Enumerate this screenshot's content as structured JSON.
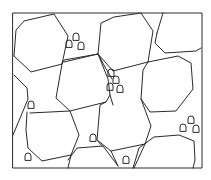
{
  "diagram": {
    "type": "grain-microstructure",
    "frame": {
      "x": 13,
      "y": 13,
      "w": 189,
      "h": 155
    },
    "stroke_color": "#2a2a2a",
    "background": "#ffffff",
    "grains": [
      {
        "id": "g1",
        "points": "14,56 16,30 24,21 54,14 68,36 62,64 31,72 14,56"
      },
      {
        "id": "g2",
        "points": "98,54 101,23 114,17 141,13 153,31 148,62 113,71 98,54"
      },
      {
        "id": "g3",
        "points": "157,33 163,13"
      },
      {
        "id": "g4",
        "points": "157,33 155,43 165,53 196,51 201,48"
      },
      {
        "id": "g5",
        "points": "62,64 56,98 70,111 106,102 110,95 108,79 98,54 64,62"
      },
      {
        "id": "g6",
        "points": "148,62 143,70 141,99 150,112 176,111 193,89 191,63 178,56 148,62"
      },
      {
        "id": "g7",
        "points": "14,75 27,88 28,99 13,135"
      },
      {
        "id": "g8",
        "points": "27,112 26,130 28,148 42,161 71,155 79,135 70,111 30,113"
      },
      {
        "id": "g9",
        "points": "106,102 100,105 97,140 111,151 145,144 151,126 141,99"
      },
      {
        "id": "g10",
        "points": "68,160 77,148 103,146 118,166"
      },
      {
        "id": "g11",
        "points": "133,168 139,148 154,137 179,135 194,141 195,160 193,168"
      },
      {
        "id": "g12",
        "points": "111,151 118,166"
      },
      {
        "id": "g13",
        "points": "145,144 134,168"
      },
      {
        "id": "g14",
        "points": "71,155 68,168"
      },
      {
        "id": "g15",
        "points": "98,54 105,67 112,79"
      },
      {
        "id": "g16",
        "points": "110,95 113,105"
      },
      {
        "id": "g17",
        "points": "97,140 102,146"
      },
      {
        "id": "g18",
        "points": "62,64 64,60 98,54"
      }
    ],
    "particles": [
      {
        "id": "p1",
        "x": 69,
        "y": 44
      },
      {
        "id": "p2",
        "x": 76,
        "y": 37
      },
      {
        "id": "p3",
        "x": 81,
        "y": 46
      },
      {
        "id": "p4",
        "x": 111,
        "y": 73
      },
      {
        "id": "p5",
        "x": 116,
        "y": 80
      },
      {
        "id": "p6",
        "x": 110,
        "y": 87
      },
      {
        "id": "p7",
        "x": 120,
        "y": 89
      },
      {
        "id": "p8",
        "x": 31,
        "y": 105
      },
      {
        "id": "p9",
        "x": 93,
        "y": 138
      },
      {
        "id": "p10",
        "x": 28,
        "y": 157
      },
      {
        "id": "p11",
        "x": 126,
        "y": 160
      },
      {
        "id": "p12",
        "x": 191,
        "y": 120
      },
      {
        "id": "p13",
        "x": 183,
        "y": 128
      },
      {
        "id": "p14",
        "x": 196,
        "y": 129
      }
    ]
  }
}
